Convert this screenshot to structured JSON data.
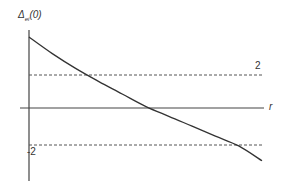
{
  "chart_data": {
    "type": "line",
    "title": "",
    "ylabel": "Δ_ei(0)",
    "ylabel_main": "Δ",
    "ylabel_sub": "ei",
    "ylabel_arg": "(0)",
    "xlabel": "r",
    "reference_lines": [
      {
        "y": 2,
        "label": "2",
        "style": "dashed"
      },
      {
        "y": -2,
        "label": "-2",
        "style": "dashed"
      }
    ],
    "series": [
      {
        "name": "Δ_ei(0) vs r",
        "style": "solid",
        "x": [
          0,
          0.1,
          0.2,
          0.3,
          0.4,
          0.5,
          0.6,
          0.7,
          0.8,
          0.9,
          1.0
        ],
        "values": [
          4.3,
          3.3,
          2.4,
          1.6,
          0.85,
          0.1,
          -0.5,
          -1.1,
          -1.7,
          -2.3,
          -3.2
        ]
      }
    ],
    "axis_ranges": {
      "x": [
        0,
        1.0
      ],
      "y": [
        -4.5,
        4.5
      ]
    },
    "grid": false,
    "legend": "none",
    "color": "#333333"
  }
}
